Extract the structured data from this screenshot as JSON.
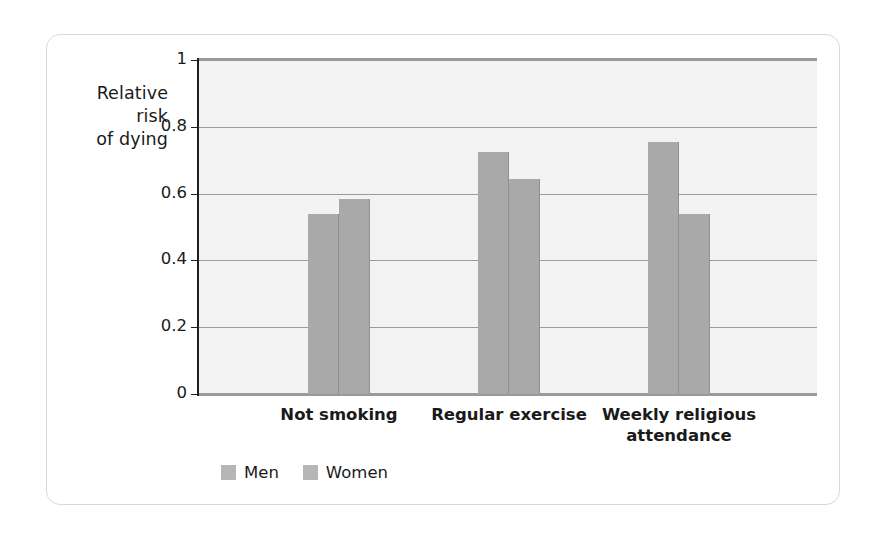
{
  "chart_data": {
    "type": "bar",
    "title": "",
    "subtitle": "",
    "ylabel": "Relative risk of dying",
    "ylabel_lines": [
      "Relative",
      "risk",
      "of dying"
    ],
    "xlabel": "",
    "categories": [
      "Not smoking",
      "Regular exercise",
      "Weekly religious attendance"
    ],
    "category_lines": [
      [
        "Not smoking"
      ],
      [
        "Regular exercise"
      ],
      [
        "Weekly religious",
        "attendance"
      ]
    ],
    "series": [
      {
        "name": "Men",
        "values": [
          0.54,
          0.725,
          0.755
        ]
      },
      {
        "name": "Women",
        "values": [
          0.585,
          0.645,
          0.54
        ]
      }
    ],
    "ylim": [
      0,
      1
    ],
    "yticks": [
      0,
      0.2,
      0.4,
      0.6,
      0.8,
      1
    ],
    "ytick_labels": [
      "0",
      "0.2",
      "0.4",
      "0.6",
      "0.8",
      "1"
    ],
    "grid": true,
    "legend_position": "bottom-left",
    "legend_entries": [
      "Men",
      "Women"
    ],
    "colors": {
      "bar_fill": "#a9a9a9",
      "legend_swatch": "#b6b6b6",
      "plot_background": "#f3f3f3",
      "gridline": "#9b9b9b",
      "axis": "#1f1f1f",
      "frame": "#9a9a9a",
      "panel_border": "#d9d9d9",
      "text": "#1a1a1a"
    }
  }
}
